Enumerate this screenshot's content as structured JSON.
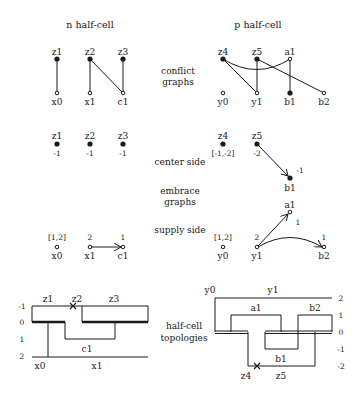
{
  "titles": {
    "n": "n half-cell",
    "p": "p half-cell"
  },
  "row_labels": {
    "conflict_1": "conflict",
    "conflict_2": "graphs",
    "center": "center side",
    "embrace_1": "embrace",
    "embrace_2": "graphs",
    "supply": "supply side",
    "topo_1": "half-cell",
    "topo_2": "topologies"
  },
  "conflict_graphs": {
    "n": {
      "nodes": [
        {
          "id": "z1",
          "label": "z1",
          "filled": true
        },
        {
          "id": "z2",
          "label": "z2",
          "filled": true
        },
        {
          "id": "z3",
          "label": "z3",
          "filled": true
        },
        {
          "id": "x0",
          "label": "x0",
          "filled": false
        },
        {
          "id": "x1",
          "label": "x1",
          "filled": false
        },
        {
          "id": "c1",
          "label": "c1",
          "filled": false
        }
      ],
      "edges": [
        [
          "z1",
          "x0"
        ],
        [
          "z2",
          "x1"
        ],
        [
          "z2",
          "c1"
        ],
        [
          "z3",
          "c1"
        ]
      ]
    },
    "p": {
      "nodes": [
        {
          "id": "z4",
          "label": "z4",
          "filled": true
        },
        {
          "id": "z5",
          "label": "z5",
          "filled": true
        },
        {
          "id": "a1",
          "label": "a1",
          "filled": false
        },
        {
          "id": "y0",
          "label": "y0",
          "filled": false
        },
        {
          "id": "y1",
          "label": "y1",
          "filled": false
        },
        {
          "id": "b1",
          "label": "b1",
          "filled": true
        },
        {
          "id": "b2",
          "label": "b2",
          "filled": false
        }
      ],
      "edges": [
        [
          "z4",
          "y1"
        ],
        [
          "z4",
          "a1"
        ],
        [
          "z5",
          "y1"
        ],
        [
          "z5",
          "b2"
        ],
        [
          "a1",
          "b1"
        ]
      ]
    }
  },
  "center_side": {
    "n": [
      {
        "label": "z1",
        "value": "-1"
      },
      {
        "label": "z2",
        "value": "-1"
      },
      {
        "label": "z3",
        "value": "-1"
      }
    ],
    "p": [
      {
        "label": "z4",
        "value": "[-1,-2]"
      },
      {
        "label": "z5",
        "value": "-2"
      },
      {
        "label": "b1",
        "value": "-1"
      }
    ],
    "p_edges": [
      [
        "z5",
        "b1"
      ]
    ]
  },
  "supply_side": {
    "n": [
      {
        "label": "x0",
        "value": "[1,2]"
      },
      {
        "label": "x1",
        "value": "2"
      },
      {
        "label": "c1",
        "value": "1"
      }
    ],
    "n_edges": [
      [
        "x1",
        "c1"
      ]
    ],
    "p": [
      {
        "label": "y0",
        "value": "[1,2]"
      },
      {
        "label": "y1",
        "value": "2"
      },
      {
        "label": "a1",
        "value": "1"
      },
      {
        "label": "b2",
        "value": "1"
      }
    ],
    "p_edges": [
      [
        "y1",
        "a1"
      ],
      [
        "y1",
        "b2"
      ]
    ]
  },
  "topologies": {
    "n": {
      "levels": [
        "-1",
        "0",
        "1",
        "2"
      ],
      "labels": {
        "z1": "z1",
        "z2": "z2",
        "z3": "z3",
        "c1": "c1",
        "x0": "x0",
        "x1": "x1"
      }
    },
    "p": {
      "levels": [
        "2",
        "1",
        "0",
        "-1",
        "-2"
      ],
      "labels": {
        "y0": "y0",
        "y1": "y1",
        "a1": "a1",
        "b2": "b2",
        "b1": "b1",
        "z4": "z4",
        "z5": "z5"
      }
    }
  }
}
